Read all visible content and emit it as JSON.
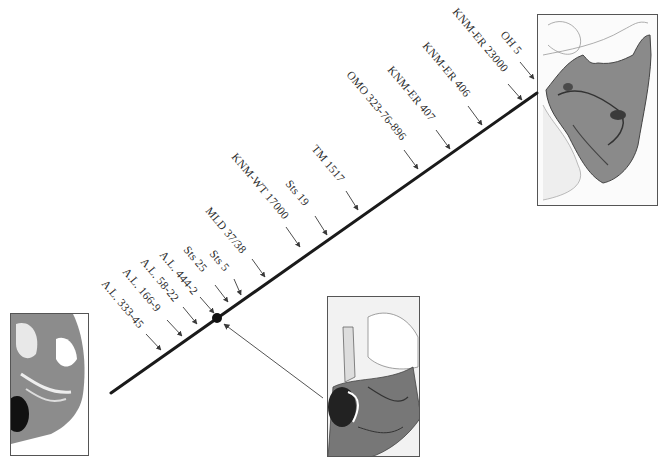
{
  "diagram": {
    "type": "timeline",
    "colors": {
      "axis": "#1a1a1a",
      "arrow": "#3a3a3a",
      "text": "#2a2a2a",
      "frame": "#555555"
    },
    "axis": {
      "x1": 111,
      "y1": 393,
      "x2": 537,
      "y2": 93
    },
    "marker": {
      "x": 217,
      "y": 318,
      "r": 5
    },
    "pointer": {
      "x1": 323,
      "y1": 398,
      "x2": 224,
      "y2": 324
    },
    "specimens": [
      {
        "label": "A.L. 333-45",
        "tx": 101,
        "ty": 284,
        "ax1": 146,
        "ay1": 334,
        "ax2": 161,
        "ay2": 350
      },
      {
        "label": "A.L. 166-9",
        "tx": 122,
        "ty": 272,
        "ax1": 167,
        "ay1": 320,
        "ax2": 182,
        "ay2": 336
      },
      {
        "label": "A.L. 58-22",
        "tx": 140,
        "ty": 262,
        "ax1": 183,
        "ay1": 307,
        "ax2": 197,
        "ay2": 324
      },
      {
        "label": "A.L. 444-2",
        "tx": 159,
        "ty": 255,
        "ax1": 200,
        "ay1": 297,
        "ax2": 214,
        "ay2": 313
      },
      {
        "label": "Sts 25",
        "tx": 183,
        "ty": 250,
        "ax1": 215,
        "ay1": 285,
        "ax2": 228,
        "ay2": 302
      },
      {
        "label": "Sts 5",
        "tx": 209,
        "ty": 254,
        "ax1": 234,
        "ay1": 279,
        "ax2": 241,
        "ay2": 295
      },
      {
        "label": "MLD 37/38",
        "tx": 205,
        "ty": 211,
        "ax1": 252,
        "ay1": 259,
        "ax2": 265,
        "ay2": 277
      },
      {
        "label": "KNM-WT 17000",
        "tx": 231,
        "ty": 157,
        "ax1": 286,
        "ay1": 227,
        "ax2": 300,
        "ay2": 247
      },
      {
        "label": "Sts 19",
        "tx": 285,
        "ty": 184,
        "ax1": 315,
        "ay1": 216,
        "ax2": 327,
        "ay2": 235
      },
      {
        "label": "TM 1517",
        "tx": 311,
        "ty": 149,
        "ax1": 346,
        "ay1": 191,
        "ax2": 358,
        "ay2": 210
      },
      {
        "label": "OMO 323-76-896",
        "tx": 346,
        "ty": 75,
        "ax1": 404,
        "ay1": 150,
        "ax2": 418,
        "ay2": 169
      },
      {
        "label": "KNM-ER 407",
        "tx": 387,
        "ty": 70,
        "ax1": 436,
        "ay1": 130,
        "ax2": 450,
        "ay2": 149
      },
      {
        "label": "KNM-ER 406",
        "tx": 422,
        "ty": 46,
        "ax1": 468,
        "ay1": 106,
        "ax2": 482,
        "ay2": 125
      },
      {
        "label": "KNM-ER 23000",
        "tx": 452,
        "ty": 12,
        "ax1": 508,
        "ay1": 84,
        "ax2": 522,
        "ay2": 100
      },
      {
        "label": "OH 5",
        "tx": 500,
        "ty": 35,
        "ax1": 520,
        "ay1": 62,
        "ax2": 534,
        "ay2": 79
      }
    ],
    "images": [
      {
        "name": "cranial-base-drawing-robust",
        "left": 537,
        "top": 14,
        "width": 121,
        "height": 192
      },
      {
        "name": "cranial-base-drawing-middle",
        "left": 327,
        "top": 296,
        "width": 93,
        "height": 161
      },
      {
        "name": "cranial-base-drawing-left",
        "left": 10,
        "top": 313,
        "width": 79,
        "height": 143
      }
    ]
  }
}
